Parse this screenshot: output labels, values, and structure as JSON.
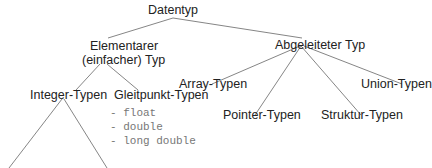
{
  "diagram": {
    "type": "tree",
    "root": "Datentyp",
    "nodes": {
      "root": "Datentyp",
      "elementary_line1": "Elementarer",
      "elementary_line2": "(einfacher) Typ",
      "derived": "Abgeleiteter Typ",
      "integer": "Integer-Typen",
      "float": "Gleitpunkt-Typen",
      "array": "Array-Typen",
      "pointer": "Pointer-Typen",
      "struct": "Struktur-Typen",
      "union": "Union-Typen"
    },
    "float_types": [
      "- float",
      "- double",
      "- long double"
    ],
    "edges": [
      [
        "Datentyp",
        "Elementarer (einfacher) Typ"
      ],
      [
        "Datentyp",
        "Abgeleiteter Typ"
      ],
      [
        "Elementarer (einfacher) Typ",
        "Integer-Typen"
      ],
      [
        "Elementarer (einfacher) Typ",
        "Gleitpunkt-Typen"
      ],
      [
        "Abgeleiteter Typ",
        "Array-Typen"
      ],
      [
        "Abgeleiteter Typ",
        "Pointer-Typen"
      ],
      [
        "Abgeleiteter Typ",
        "Struktur-Typen"
      ],
      [
        "Abgeleiteter Typ",
        "Union-Typen"
      ],
      [
        "Integer-Typen",
        "(cut off left)"
      ],
      [
        "Integer-Typen",
        "(cut off right)"
      ]
    ]
  }
}
